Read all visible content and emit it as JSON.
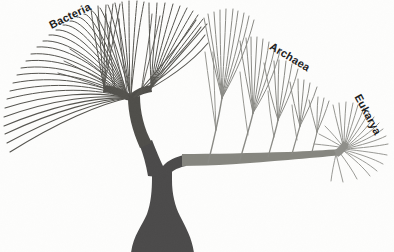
{
  "figure": {
    "kind": "phylogenetic-tree-diagram",
    "title_visible": false,
    "background_color": "#fdfdfc",
    "labels": {
      "bacteria": "Bacteria",
      "archaea": "Archaea",
      "eukarya": "Eukarya"
    },
    "colors": {
      "trunk": "#4b4a4a",
      "bacteria_branches": "#55544f",
      "archaea_branches": "#8a8a85",
      "eukarya_branches": "#8f8f8a",
      "label_text": "#1c1c1c"
    },
    "structure": {
      "root_note": "thick flared trunk rising from bottom edge",
      "root_base_x": 161,
      "root_base_y": 252,
      "first_split_x": 161,
      "first_split_y": 168,
      "left_clade": "Bacteria",
      "right_clade": "Archaea + Eukarya",
      "bacteria_node_x": 147,
      "bacteria_node_y": 138,
      "archaea_spine_end_x": 320,
      "archaea_spine_end_y": 157,
      "eukarya_node_x": 343,
      "eukarya_node_y": 151,
      "bacteria_tip_count": 58,
      "archaea_tip_count": 34,
      "eukarya_tip_count": 22
    }
  }
}
